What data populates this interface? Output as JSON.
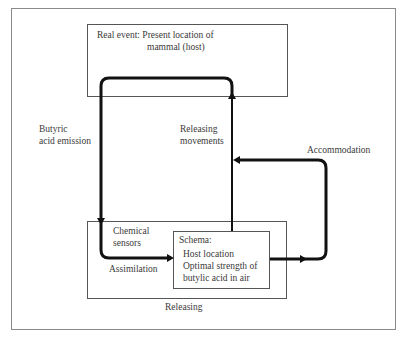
{
  "diagram": {
    "type": "flow-diagram",
    "real_event_box": {
      "line1": "Real event: Present location of",
      "line2": "mammal (host)"
    },
    "releasing_box": {
      "caption": "Releasing",
      "chemical_sensors_line1": "Chemical",
      "chemical_sensors_line2": "sensors",
      "assimilation": "Assimilation"
    },
    "schema_box": {
      "title": "Schema:",
      "line1": "Host location",
      "line2": "Optimal strength of",
      "line3": "butylic acid in air"
    },
    "arrows": {
      "butyric_line1": "Butyric",
      "butyric_line2": "acid emission",
      "releasing_movements_line1": "Releasing",
      "releasing_movements_line2": "movements",
      "accommodation": "Accommodation"
    },
    "colors": {
      "line": "#111111",
      "box_border": "#555555",
      "text": "#3a3a3a"
    }
  }
}
